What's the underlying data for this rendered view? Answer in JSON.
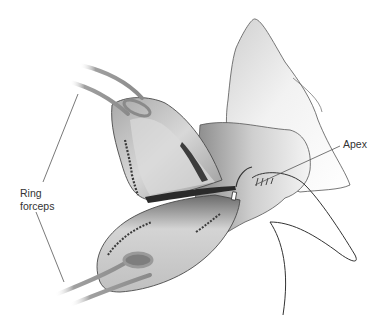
{
  "figure": {
    "labels": {
      "ring_forceps_line1": "Ring",
      "ring_forceps_line2": "forceps",
      "apex": "Apex"
    },
    "colors": {
      "background": "#ffffff",
      "tissue_light": "#e4e4e4",
      "tissue_mid": "#b8b8b8",
      "tissue_dark": "#7a7a7a",
      "instrument": "#9a9a9a",
      "outline": "#4a4a4a",
      "suture": "#333333",
      "leader_line": "#555555"
    }
  }
}
